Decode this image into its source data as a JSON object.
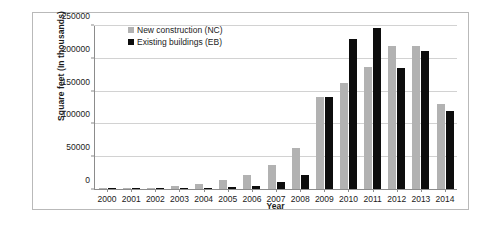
{
  "chart_data": {
    "type": "bar",
    "title": "",
    "xlabel": "Year",
    "ylabel": "Square feet (In thousands)",
    "categories": [
      "2000",
      "2001",
      "2002",
      "2003",
      "2004",
      "2005",
      "2006",
      "2007",
      "2008",
      "2009",
      "2010",
      "2011",
      "2012",
      "2013",
      "2014"
    ],
    "series": [
      {
        "name": "New construction (NC)",
        "color": "#b2b2b2",
        "values": [
          300,
          900,
          1700,
          4500,
          7000,
          13000,
          22000,
          36000,
          63000,
          141000,
          162000,
          186000,
          218000,
          218000,
          130000
        ]
      },
      {
        "name": "Existing buildings (EB)",
        "color": "#0d0d0d",
        "values": [
          200,
          500,
          1000,
          1400,
          2200,
          3000,
          4500,
          11000,
          21000,
          140000,
          228000,
          245000,
          184000,
          210000,
          119000
        ]
      }
    ],
    "ylim": [
      0,
      250000
    ],
    "yticks": [
      0,
      50000,
      100000,
      150000,
      200000,
      250000
    ],
    "ytick_labels": [
      "0",
      "50000",
      "100000",
      "150000",
      "200000",
      "250000"
    ],
    "grid": true,
    "legend_position": "top-left-inside"
  },
  "colors": {
    "new_construction": "#b2b2b2",
    "existing_buildings": "#0d0d0d",
    "gridline": "#d2d2d2",
    "axis": "#8c8c8c",
    "border": "#b9b9b9",
    "text": "#1b1b1b",
    "background": "#ffffff"
  }
}
